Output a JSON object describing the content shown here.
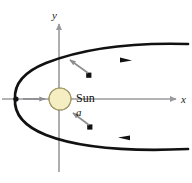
{
  "figure": {
    "type": "physics-orbit-diagram",
    "title_text": "",
    "background_color": "#ffffff",
    "width": 192,
    "height": 183
  },
  "axes": {
    "x_label": "x",
    "y_label": "y",
    "axis_color": "#9a9a9e",
    "origin": {
      "x": 59,
      "y": 99
    },
    "x_axis": {
      "start_x": 2,
      "end_x": 178,
      "y": 99,
      "arrow": "right"
    },
    "y_axis": {
      "x": 59,
      "start_y": 172,
      "end_y": 22,
      "arrow": "up"
    },
    "x_label_pos": {
      "x": 183,
      "y": 102
    },
    "y_label_pos": {
      "x": 54,
      "y": 18
    }
  },
  "sun": {
    "label": "Sun",
    "label_pos": {
      "x": 76,
      "y": 101
    },
    "center": {
      "x": 60,
      "y": 99
    },
    "radius": 11,
    "fill_color": "#f5eec2",
    "stroke_color": "#7a6f3c"
  },
  "orbit": {
    "name": "parabolic-trajectory",
    "curve_color": "#111111",
    "curve_width": 2.6,
    "vertex": {
      "x": 15,
      "y": 99
    },
    "upper_end": {
      "x": 186,
      "y": 46
    },
    "lower_end": {
      "x": 186,
      "y": 147
    },
    "direction_markers": [
      {
        "name": "upper-direction-arrow",
        "x": 126,
        "y": 68,
        "direction": "outward-right"
      },
      {
        "name": "lower-direction-arrow",
        "x": 123,
        "y": 134,
        "direction": "inward-left"
      }
    ],
    "position_dots": [
      {
        "name": "upper-body-dot",
        "x": 88,
        "y": 76
      },
      {
        "name": "lower-body-dot",
        "x": 89,
        "y": 126
      }
    ]
  },
  "acceleration_vectors": [
    {
      "name": "acceleration-vector-upper",
      "label": "",
      "color": "#8d8d92",
      "tail": {
        "x": 86,
        "y": 74
      },
      "head": {
        "x": 69,
        "y": 60
      }
    },
    {
      "name": "acceleration-vector-lower",
      "label": "a",
      "label_pos": {
        "x": 78,
        "y": 115
      },
      "color": "#8d8d92",
      "tail": {
        "x": 87,
        "y": 124
      },
      "head": {
        "x": 72,
        "y": 112
      }
    },
    {
      "name": "acceleration-vector-vertex",
      "label": "",
      "color": "#8d8d92",
      "tail": {
        "x": 22,
        "y": 99
      },
      "head": {
        "x": 45,
        "y": 99
      }
    }
  ],
  "vertex_marker": {
    "name": "perihelion-point",
    "x": 15,
    "y": 99,
    "color": "#111111"
  }
}
